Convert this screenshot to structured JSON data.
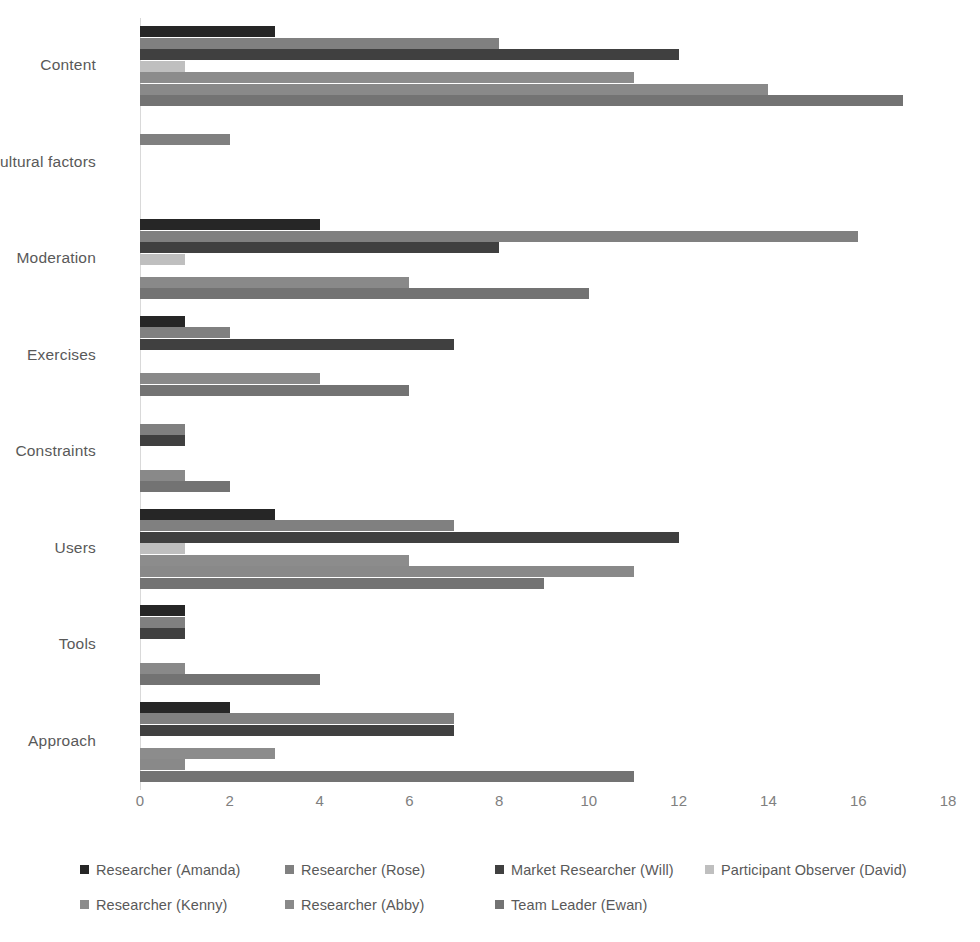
{
  "chart_data": {
    "type": "bar",
    "orientation": "horizontal",
    "title": "",
    "subtitle": "",
    "xlabel": "",
    "ylabel": "",
    "xlim": [
      0,
      18
    ],
    "xticks": [
      0,
      2,
      4,
      6,
      8,
      10,
      12,
      14,
      16,
      18
    ],
    "xtick_labels": [
      "0",
      "2",
      "4",
      "6",
      "8",
      "10",
      "12",
      "14",
      "16",
      "18"
    ],
    "grid": false,
    "legend_position": "bottom",
    "categories": [
      "Content",
      "Cultural factors",
      "Moderation",
      "Exercises",
      "Constraints",
      "Users",
      "Tools",
      "Approach"
    ],
    "series": [
      {
        "name": "Researcher (Amanda)",
        "color": "#262626",
        "values": [
          3,
          0,
          4,
          1,
          0,
          3,
          1,
          2
        ]
      },
      {
        "name": "Researcher (Rose)",
        "color": "#808080",
        "values": [
          8,
          2,
          16,
          2,
          1,
          7,
          1,
          7
        ]
      },
      {
        "name": "Market Researcher (Will)",
        "color": "#404040",
        "values": [
          12,
          0,
          8,
          7,
          1,
          12,
          1,
          7
        ]
      },
      {
        "name": "Participant Observer (David)",
        "color": "#bfbfbf",
        "values": [
          1,
          0,
          1,
          0,
          0,
          1,
          0,
          0
        ]
      },
      {
        "name": "Researcher (Kenny)",
        "color": "#8c8c8c",
        "values": [
          11,
          0,
          0,
          0,
          0,
          6,
          0,
          3
        ]
      },
      {
        "name": "Researcher (Abby)",
        "color": "#898989",
        "values": [
          14,
          0,
          6,
          4,
          1,
          11,
          1,
          1
        ]
      },
      {
        "name": "Team Leader (Ewan)",
        "color": "#737373",
        "values": [
          17,
          0,
          10,
          6,
          2,
          9,
          4,
          11
        ]
      }
    ]
  },
  "legend": {
    "rows": [
      [
        {
          "label": "Researcher (Amanda)",
          "color": "#262626"
        },
        {
          "label": "Researcher (Rose)",
          "color": "#808080"
        },
        {
          "label": "Market Researcher (Will)",
          "color": "#404040"
        },
        {
          "label": "Participant Observer (David)",
          "color": "#bfbfbf"
        }
      ],
      [
        {
          "label": "Researcher (Kenny)",
          "color": "#8c8c8c"
        },
        {
          "label": "Researcher (Abby)",
          "color": "#898989"
        },
        {
          "label": "Team Leader (Ewan)",
          "color": "#737373"
        }
      ]
    ]
  },
  "axis": {
    "zero_line_color": "#d9d9d9",
    "tick_label_color": "#808080"
  }
}
